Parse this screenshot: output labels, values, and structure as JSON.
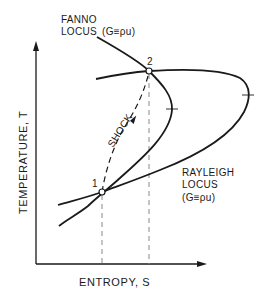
{
  "diagram": {
    "axes": {
      "x_label": "ENTROPY, S",
      "y_label": "TEMPERATURE, T"
    },
    "fanno": {
      "label_line1": "FANNO",
      "label_line2": "LOCUS",
      "condition": "(G≡ρu)"
    },
    "rayleigh": {
      "label_line1": "RAYLEIGH",
      "label_line2": "LOCUS",
      "condition": "(G≡ρu)"
    },
    "shock_label": "SHOCK",
    "points": [
      {
        "id": "1",
        "label": "1"
      },
      {
        "id": "2",
        "label": "2"
      }
    ],
    "colors": {
      "ink": "#1a1a1a",
      "dashed": "#888888",
      "background": "#ffffff"
    }
  }
}
